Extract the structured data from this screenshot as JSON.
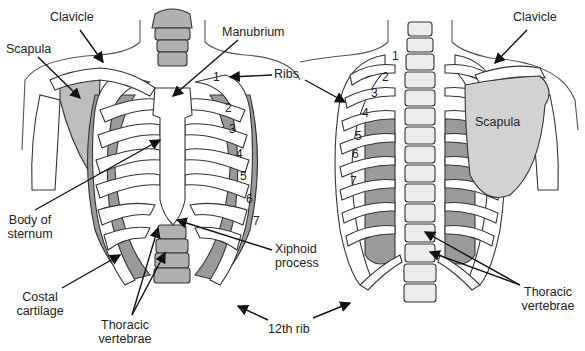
{
  "colors": {
    "bone": "#ffffff",
    "shade": "#9a9a9a",
    "dark": "#7d7d7d",
    "outline": "#333333",
    "skin": "#555555"
  },
  "views": [
    {
      "name": "anterior",
      "rib_numbers": [
        "1",
        "2",
        "3",
        "4",
        "5",
        "6",
        "7"
      ]
    },
    {
      "name": "posterior",
      "rib_numbers": [
        "1",
        "2",
        "3",
        "4",
        "5",
        "6",
        "7"
      ]
    }
  ],
  "labels": {
    "clavicle_left": "Clavicle",
    "scapula_left": "Scapula",
    "manubrium": "Manubrium",
    "ribs": "Ribs",
    "body_of_sternum_1": "Body of",
    "body_of_sternum_2": "sternum",
    "xiphoid_1": "Xiphoid",
    "xiphoid_2": "process",
    "costal_1": "Costal",
    "costal_2": "cartilage",
    "thoracic_left_1": "Thoracic",
    "thoracic_left_2": "vertebrae",
    "twelfth_rib": "12th rib",
    "clavicle_right": "Clavicle",
    "scapula_right": "Scapula",
    "thoracic_right_1": "Thoracic",
    "thoracic_right_2": "vertebrae"
  }
}
